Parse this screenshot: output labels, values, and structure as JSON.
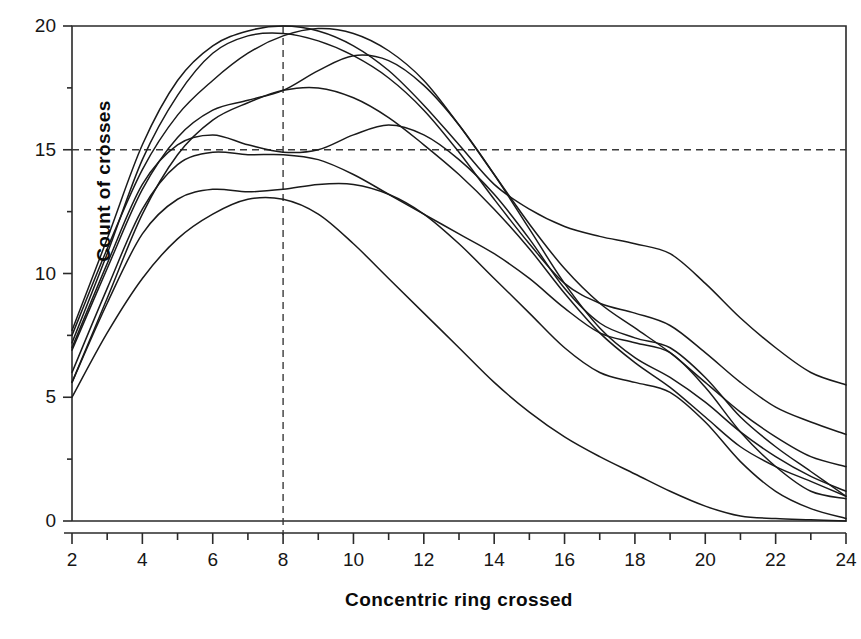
{
  "chart_data": {
    "type": "line",
    "title": "",
    "xlabel": "Concentric ring crossed",
    "ylabel": "Count of crosses",
    "xlim": [
      2,
      24
    ],
    "ylim": [
      0,
      20
    ],
    "xticks": [
      2,
      3,
      4,
      5,
      6,
      7,
      8,
      9,
      10,
      11,
      12,
      13,
      14,
      15,
      16,
      17,
      18,
      19,
      20,
      21,
      22,
      23,
      24
    ],
    "xtick_labels": [
      "2",
      "",
      "4",
      "",
      "6",
      "",
      "8",
      "",
      "10",
      "",
      "12",
      "",
      "14",
      "",
      "16",
      "",
      "18",
      "",
      "20",
      "",
      "22",
      "",
      "24"
    ],
    "yticks": [
      0,
      2.5,
      5,
      7.5,
      10,
      12.5,
      15,
      17.5,
      20
    ],
    "ytick_labels": [
      "0",
      "",
      "5",
      "",
      "10",
      "",
      "15",
      "",
      "20"
    ],
    "grid": false,
    "legend": "none",
    "line_color": "#1a1a1a",
    "reference_lines": [
      {
        "axis": "y",
        "value": 15,
        "style": "dashed"
      },
      {
        "axis": "x",
        "value": 8,
        "style": "dashed"
      }
    ],
    "x": [
      2,
      3,
      4,
      5,
      6,
      7,
      8,
      9,
      10,
      11,
      12,
      13,
      14,
      15,
      16,
      17,
      18,
      19,
      20,
      21,
      22,
      23,
      24
    ],
    "series": [
      {
        "name": "curve-1",
        "values": [
          7.7,
          11.4,
          15.2,
          17.8,
          19.2,
          19.8,
          20.0,
          19.8,
          19.2,
          18.2,
          16.8,
          15.2,
          13.6,
          12.6,
          11.9,
          11.5,
          11.2,
          10.8,
          9.6,
          8.2,
          7.0,
          6.0,
          5.5
        ]
      },
      {
        "name": "curve-2",
        "values": [
          7.2,
          10.8,
          14.6,
          17.2,
          18.9,
          19.6,
          19.7,
          19.4,
          18.8,
          17.9,
          16.6,
          14.9,
          13.0,
          11.2,
          9.6,
          8.8,
          8.4,
          7.9,
          6.8,
          5.6,
          4.6,
          4.0,
          3.5
        ]
      },
      {
        "name": "curve-3",
        "values": [
          7.5,
          11.0,
          14.2,
          16.4,
          17.8,
          18.9,
          19.6,
          19.9,
          19.7,
          19.0,
          17.8,
          16.0,
          14.0,
          12.0,
          10.2,
          8.8,
          7.8,
          6.8,
          5.6,
          4.4,
          3.4,
          2.6,
          2.2
        ]
      },
      {
        "name": "curve-4",
        "values": [
          6.9,
          10.2,
          13.4,
          15.5,
          16.6,
          17.0,
          17.4,
          18.2,
          18.8,
          18.6,
          17.6,
          16.0,
          14.0,
          11.8,
          9.6,
          7.8,
          6.6,
          5.8,
          4.8,
          3.6,
          2.6,
          1.8,
          1.2
        ]
      },
      {
        "name": "curve-5",
        "values": [
          5.6,
          9.0,
          12.4,
          14.8,
          16.2,
          16.9,
          17.4,
          17.5,
          17.1,
          16.3,
          15.2,
          14.0,
          12.6,
          11.0,
          9.2,
          7.6,
          6.4,
          5.4,
          4.2,
          3.0,
          2.2,
          1.6,
          1.0
        ]
      },
      {
        "name": "curve-6",
        "values": [
          7.0,
          10.4,
          13.6,
          15.2,
          15.6,
          15.2,
          14.9,
          15.0,
          15.6,
          16.0,
          15.6,
          14.6,
          13.2,
          11.4,
          9.4,
          8.0,
          7.4,
          7.0,
          5.8,
          4.2,
          3.0,
          2.0,
          1.0
        ]
      },
      {
        "name": "curve-7",
        "values": [
          6.0,
          9.4,
          12.6,
          14.4,
          14.9,
          14.8,
          14.8,
          14.6,
          14.0,
          13.2,
          12.4,
          11.6,
          10.8,
          9.8,
          8.6,
          7.6,
          7.2,
          6.8,
          5.4,
          3.6,
          2.2,
          1.2,
          0.9
        ]
      },
      {
        "name": "curve-8",
        "values": [
          5.6,
          8.8,
          11.6,
          13.0,
          13.4,
          13.3,
          13.4,
          13.6,
          13.6,
          13.2,
          12.4,
          11.2,
          9.8,
          8.4,
          7.0,
          6.0,
          5.6,
          5.2,
          4.0,
          2.4,
          1.2,
          0.5,
          0.1
        ]
      },
      {
        "name": "curve-9",
        "values": [
          5.0,
          7.6,
          9.8,
          11.4,
          12.4,
          13.0,
          13.0,
          12.4,
          11.2,
          9.8,
          8.4,
          7.0,
          5.6,
          4.4,
          3.4,
          2.6,
          1.9,
          1.2,
          0.6,
          0.2,
          0.1,
          0.05,
          0.0
        ]
      }
    ]
  },
  "axis": {
    "ylabel_text": "Count of crosses",
    "xlabel_text": "Concentric ring crossed"
  }
}
